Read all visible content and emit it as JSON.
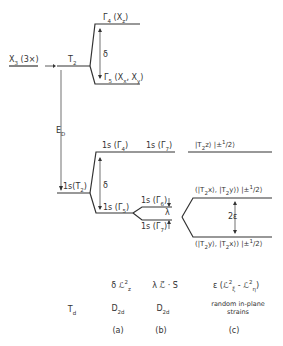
{
  "levels": {
    "x3": {
      "label": "X",
      "sub": "3",
      "suffix": " (3×)"
    },
    "t2": {
      "label": "T",
      "sub": "2"
    },
    "gamma4": {
      "label": "Γ",
      "sub": "4",
      "suffix": " (X",
      "sub2": "z",
      "end": ")"
    },
    "gamma5": {
      "label": "Γ",
      "sub": "5",
      "suffix": " (X",
      "sub2": "x",
      "mid": ", X",
      "sub3": "y",
      "end": ")"
    },
    "delta_top": "δ",
    "ed": {
      "label": "E",
      "sub": "D"
    },
    "ls_t2": {
      "label": "1s(T",
      "sub": "2",
      "end": ")"
    },
    "ls_g4": {
      "label": "1s (Γ",
      "sub": "4",
      "end": ")"
    },
    "ls_g7_top": {
      "label": "1s (Γ",
      "sub": "7",
      "end": ")"
    },
    "delta_bot": "δ",
    "ls_g5": {
      "label": "1s (Γ",
      "sub": "5",
      "end": ")"
    },
    "ls_g6": {
      "label": "1s (Γ",
      "sub": "6",
      "end": ")"
    },
    "ls_g7": {
      "label": "1s (Γ",
      "sub": "7",
      "end": ")"
    },
    "lambda": "λ",
    "state_top": {
      "a": "|T",
      "sub": "2",
      "b": "z⟩ |±",
      "sup": "1",
      "c": "/2⟩"
    },
    "state_mid": {
      "a": "(|T",
      "sub": "2",
      "b": "x⟩, |T",
      "sub2": "2",
      "c": "y⟩) |±",
      "sup": "1",
      "d": "/2⟩"
    },
    "two_eps": "2ε",
    "state_bot": {
      "a": "(|T",
      "sub": "2",
      "b": "y⟩, |T",
      "sub2": "2",
      "c": "x⟩) |±",
      "sup": "1",
      "d": "/2⟩"
    }
  },
  "columns": {
    "td": {
      "label": "T",
      "sub": "d"
    },
    "a": {
      "hamiltonian": "δ ℒ",
      "h_sup": "2",
      "h_sub": "z",
      "symmetry": "D",
      "sym_sub": "2d",
      "tag": "(a)"
    },
    "b": {
      "hamiltonian": "λ ℒ⃗ · S⃗",
      "symmetry": "D",
      "sym_sub": "2d",
      "tag": "(b)"
    },
    "c": {
      "hamiltonian": "ε (ℒ",
      "h_sup1": "2",
      "h_sub1": "ξ",
      "mid": " - ℒ",
      "h_sup2": "2",
      "h_sub2": "η",
      "end": ")",
      "desc1": "random in-plane",
      "desc2": "strains",
      "tag": "(c)"
    }
  }
}
